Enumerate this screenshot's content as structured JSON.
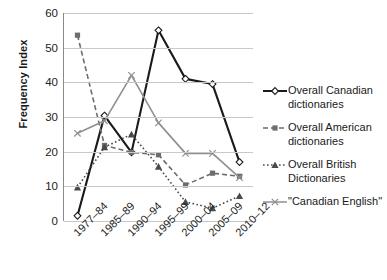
{
  "chart_data": {
    "type": "line",
    "title": "",
    "xlabel": "",
    "ylabel": "Frequency Index",
    "categories": [
      "1977–84",
      "1985–89",
      "1990–94",
      "1995–99",
      "2000–04",
      "2005–09",
      "2010–12"
    ],
    "ylim": [
      0,
      60
    ],
    "yticks": [
      0,
      10,
      20,
      30,
      40,
      50,
      60
    ],
    "grid": true,
    "legend_position": "right",
    "series": [
      {
        "name": "Overall Canadian dictionaries",
        "label_line1": "Overall Canadian",
        "label_line2": "dictionaries",
        "marker": "open-diamond",
        "line_style": "solid",
        "color": "#1a1a1a",
        "values": [
          1.5,
          30.4,
          19.8,
          55.0,
          41.0,
          39.5,
          17.0
        ]
      },
      {
        "name": "Overall American dictionaries",
        "label_line1": "Overall American",
        "label_line2": "dictionaries",
        "marker": "filled-square",
        "line_style": "dashed",
        "color": "#6d6d6d",
        "values": [
          53.6,
          21.8,
          19.8,
          19.1,
          10.4,
          13.8,
          12.9
        ]
      },
      {
        "name": "Overall British Dictionaries",
        "label_line1": "Overall British",
        "label_line2": "Dictionaries",
        "marker": "filled-triangle",
        "line_style": "dotted",
        "color": "#4a4a4a",
        "values": [
          9.7,
          21.3,
          25.0,
          15.7,
          5.5,
          3.7,
          7.2
        ]
      },
      {
        "name": "\"Canadian English\"",
        "label_line1": "\"Canadian English\"",
        "label_line2": "",
        "marker": "cross-x",
        "line_style": "solid",
        "color": "#8f8f8f",
        "values": [
          25.3,
          28.9,
          42.0,
          28.3,
          19.5,
          19.5,
          12.5
        ]
      }
    ]
  }
}
